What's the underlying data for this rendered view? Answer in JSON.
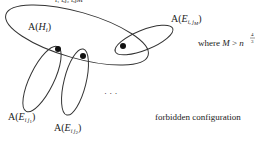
{
  "labels": {
    "hi": {
      "pre": "A(",
      "var": "H",
      "sub": "i",
      "post": ")"
    },
    "ejm": {
      "pre": "A(",
      "var": "E",
      "sub": "i, j",
      "subsub": "M",
      "post": ")"
    },
    "ej1": {
      "pre": "A(",
      "var": "E",
      "sub": "i j",
      "subsub": "1",
      "post": ")"
    },
    "ej2": {
      "pre": "A(",
      "var": "E",
      "sub": "i j",
      "subsub": "2",
      "post": ")"
    },
    "condition": {
      "text": "where ",
      "var": "M",
      "op": " > ",
      "base": "n",
      "exp_num": "4",
      "exp_den": "3"
    },
    "ellipsis": "· · ·",
    "caption": "forbidden configuration"
  },
  "top_fragment": "i1          i,j2          i,jM",
  "colors": {
    "stroke": "#333333",
    "dot": "#111111",
    "text": "#222222"
  }
}
